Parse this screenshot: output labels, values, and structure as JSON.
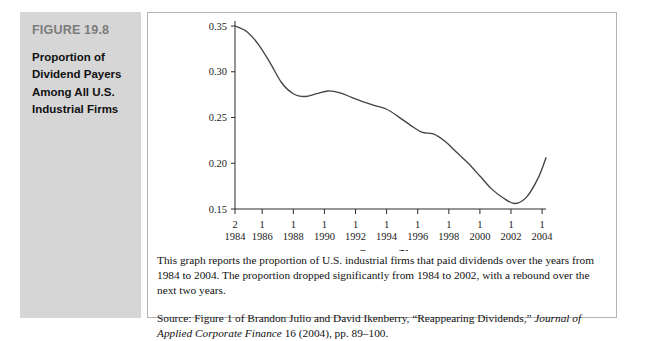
{
  "figure": {
    "number_label": "FIGURE 19.8",
    "title_lines": [
      "Proportion of",
      "Dividend Payers",
      "Among All U.S.",
      "Industrial Firms"
    ],
    "note": "This graph reports the proportion of U.S. industrial firms that paid dividends over the years from 1984 to 2004. The proportion dropped significantly from 1984 to 2002, with a rebound over the next two years.",
    "source_prefix": "Source: Figure 1 of Brandon Julio and David Ikenberry, “Reappearing Dividends,” ",
    "source_italic": "Journal of Applied Corporate Finance",
    "source_suffix": " 16 (2004), pp. 89–100."
  },
  "colors": {
    "sidebar_bg": "#d6d6d6",
    "figure_number": "#7b7b7b",
    "curve": "#444444",
    "axis": "#2b2b2b",
    "box_border": "#b4b4b4"
  },
  "chart_data": {
    "type": "line",
    "title": "",
    "xlabel": "Quarter/Year",
    "ylabel": "",
    "ylim": [
      0.15,
      0.35
    ],
    "xlim": [
      1984.25,
      2004.25
    ],
    "grid": false,
    "legend": "none",
    "ytick_labels": [
      "0.15",
      "0.20",
      "0.25",
      "0.30",
      "0.35"
    ],
    "ytick_values": [
      0.15,
      0.2,
      0.25,
      0.3,
      0.35
    ],
    "xtick_quarters": [
      "2",
      "1",
      "1",
      "1",
      "1",
      "1",
      "1",
      "1",
      "1",
      "1",
      "1"
    ],
    "xtick_years": [
      "1984",
      "1986",
      "1988",
      "1990",
      "1992",
      "1994",
      "1996",
      "1998",
      "2000",
      "2002",
      "2004"
    ],
    "xtick_positions": [
      1984.25,
      1986.0,
      1988.0,
      1990.0,
      1992.0,
      1994.0,
      1996.0,
      1998.0,
      2000.0,
      2002.0,
      2004.0
    ],
    "series": [
      {
        "name": "Proportion of dividend payers",
        "x": [
          1984.25,
          1985.0,
          1985.75,
          1986.5,
          1987.25,
          1988.0,
          1988.75,
          1989.5,
          1990.25,
          1991.0,
          1991.75,
          1992.5,
          1993.25,
          1994.0,
          1994.75,
          1995.5,
          1996.25,
          1997.0,
          1997.75,
          1998.5,
          1999.25,
          2000.0,
          2000.75,
          2001.5,
          2002.25,
          2003.0,
          2003.75,
          2004.25
        ],
        "values": [
          0.35,
          0.344,
          0.33,
          0.31,
          0.288,
          0.276,
          0.273,
          0.276,
          0.279,
          0.277,
          0.272,
          0.267,
          0.263,
          0.259,
          0.251,
          0.242,
          0.234,
          0.232,
          0.224,
          0.212,
          0.2,
          0.186,
          0.172,
          0.162,
          0.156,
          0.163,
          0.184,
          0.206
        ]
      }
    ]
  }
}
